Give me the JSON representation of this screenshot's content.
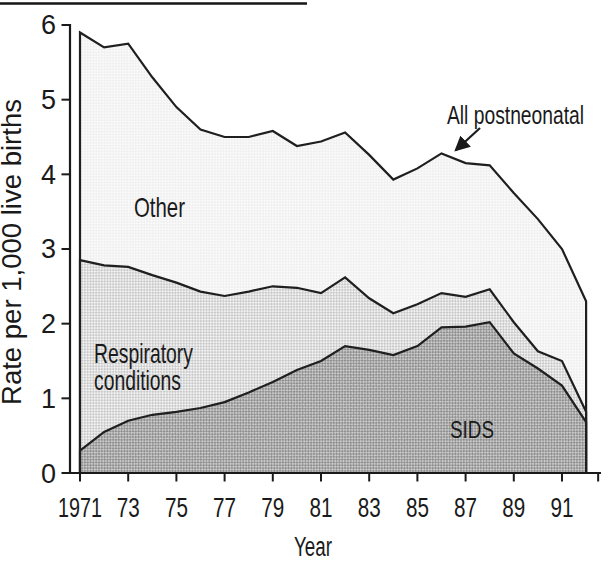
{
  "figure": {
    "y_axis_label": "Rate per 1,000 live births",
    "x_axis_label": "Year"
  },
  "chart_data": {
    "type": "area",
    "stacked": true,
    "title": "",
    "xlabel": "Year",
    "ylabel": "Rate per 1,000 live births",
    "xlim": [
      1971,
      1992
    ],
    "ylim": [
      0,
      6
    ],
    "grid": false,
    "line_color": "#1f1f1f",
    "x": [
      1971,
      1972,
      1973,
      1974,
      1975,
      1976,
      1977,
      1978,
      1979,
      1980,
      1981,
      1982,
      1983,
      1984,
      1985,
      1986,
      1987,
      1988,
      1989,
      1990,
      1991,
      1992
    ],
    "series": [
      {
        "name": "SIDS",
        "values": [
          0.3,
          0.55,
          0.7,
          0.78,
          0.82,
          0.87,
          0.95,
          1.08,
          1.22,
          1.38,
          1.5,
          1.7,
          1.65,
          1.58,
          1.7,
          1.95,
          1.96,
          2.02,
          1.6,
          1.4,
          1.17,
          0.68
        ],
        "fill_base": "#d2d2d2",
        "fill_dot": "#8f8f8f"
      },
      {
        "name": "Respiratory conditions",
        "values": [
          2.55,
          2.23,
          2.06,
          1.87,
          1.73,
          1.56,
          1.42,
          1.35,
          1.28,
          1.1,
          0.91,
          0.92,
          0.69,
          0.56,
          0.56,
          0.46,
          0.4,
          0.44,
          0.42,
          0.23,
          0.33,
          0.14
        ],
        "fill_base": "#f1f1f1",
        "fill_dot": "#bdbdbd"
      },
      {
        "name": "Other",
        "values": [
          3.05,
          2.92,
          2.99,
          2.65,
          2.35,
          2.17,
          2.13,
          2.07,
          2.08,
          1.9,
          2.03,
          1.94,
          1.92,
          1.79,
          1.82,
          1.87,
          1.79,
          1.66,
          1.73,
          1.77,
          1.5,
          1.48
        ],
        "fill_base": "#fafafa",
        "fill_dot": "#e2e2e2"
      }
    ],
    "all_postneonatal_total": [
      5.9,
      5.7,
      5.75,
      5.3,
      4.9,
      4.6,
      4.5,
      4.5,
      4.58,
      4.38,
      4.44,
      4.56,
      4.26,
      3.93,
      4.08,
      4.28,
      4.15,
      4.12,
      3.75,
      3.4,
      3.0,
      2.3
    ],
    "y_ticks": [
      "0",
      "1",
      "2",
      "3",
      "4",
      "5",
      "6"
    ],
    "x_ticks": [
      {
        "label": "1971",
        "year": 1971
      },
      {
        "label": "73",
        "year": 1973
      },
      {
        "label": "75",
        "year": 1975
      },
      {
        "label": "77",
        "year": 1977
      },
      {
        "label": "79",
        "year": 1979
      },
      {
        "label": "81",
        "year": 1981
      },
      {
        "label": "83",
        "year": 1983
      },
      {
        "label": "85",
        "year": 1985
      },
      {
        "label": "87",
        "year": 1987
      },
      {
        "label": "89",
        "year": 1989
      },
      {
        "label": "91",
        "year": 1991
      },
      {
        "label": "",
        "year": 1992.5
      }
    ],
    "annotations": {
      "total_label": "All postneonatal",
      "respiratory_line1": "Respiratory",
      "respiratory_line2": "conditions"
    }
  }
}
